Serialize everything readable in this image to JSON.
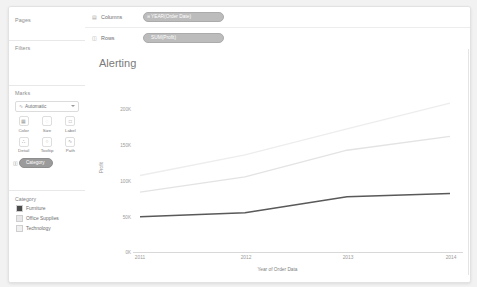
{
  "window": {
    "title": "Tableau Worksheet"
  },
  "sidebar": {
    "pages": {
      "title": "Pages"
    },
    "filters": {
      "title": "Filters"
    },
    "marks": {
      "title": "Marks",
      "mark_type": "Automatic",
      "mark_type_icon": "line-mark-icon",
      "buttons": [
        {
          "label": "Color",
          "icon": "color-icon",
          "glyph": "▦"
        },
        {
          "label": "Size",
          "icon": "size-icon",
          "glyph": "◌"
        },
        {
          "label": "Label",
          "icon": "label-icon",
          "glyph": "□"
        },
        {
          "label": "Detail",
          "icon": "detail-icon",
          "glyph": "∴"
        },
        {
          "label": "Tooltip",
          "icon": "tooltip-icon",
          "glyph": "○"
        },
        {
          "label": "Path",
          "icon": "path-icon",
          "glyph": "∿"
        }
      ],
      "encoding_pill": {
        "label": "Category",
        "icon": "color-encoding-icon"
      }
    },
    "legend": {
      "title": "Category",
      "items": [
        {
          "label": "Furniture",
          "color": "#4a4a4a"
        },
        {
          "label": "Office Supplies",
          "color": "#e8e8e8"
        },
        {
          "label": "Technology",
          "color": "#f0f0f0"
        }
      ]
    }
  },
  "shelves": {
    "columns": {
      "label": "Columns",
      "icon": "columns-icon",
      "pill": "YEAR(Order Date)",
      "pill_prefix": "⊞"
    },
    "rows": {
      "label": "Rows",
      "icon": "rows-icon",
      "pill": "SUM(Profit)",
      "pill_prefix": ""
    }
  },
  "chart_data": {
    "type": "line",
    "title": "Alerting",
    "xlabel": "Year of Order Data",
    "ylabel": "Profit",
    "categories": [
      "2011",
      "2012",
      "2013",
      "2014"
    ],
    "x": [
      2011,
      2012,
      2013,
      2014
    ],
    "yticks": [
      "0K",
      "50K",
      "100K",
      "150K",
      "200K"
    ],
    "ytick_values": [
      0,
      50000,
      100000,
      150000,
      200000
    ],
    "ylim": [
      0,
      215000
    ],
    "grid": false,
    "legend_position": "left-sidebar",
    "series": [
      {
        "name": "Furniture",
        "color": "#595959",
        "width": 1.6,
        "values": [
          53000,
          59000,
          83000,
          88000
        ]
      },
      {
        "name": "Office Supplies",
        "color": "#e3e3e3",
        "width": 1.3,
        "values": [
          90000,
          113000,
          153000,
          174000
        ]
      },
      {
        "name": "Technology",
        "color": "#ededed",
        "width": 1.3,
        "values": [
          115000,
          146000,
          185000,
          224000
        ]
      }
    ]
  }
}
